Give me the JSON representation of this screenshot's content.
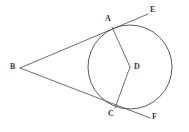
{
  "figure": {
    "type": "geometry-diagram",
    "width": 189,
    "height": 132,
    "background_color": "#ffffff",
    "stroke_color": "#4a4a4a",
    "label_color": "#3a3a3a"
  },
  "circle": {
    "name": "main-circle",
    "center_label": "D",
    "cx": 130,
    "cy": 67,
    "r": 42
  },
  "points": {
    "B": {
      "label": "B",
      "x": 20,
      "y": 68,
      "label_x": 10,
      "label_y": 63,
      "role": "external-point"
    },
    "A": {
      "label": "A",
      "x": 112,
      "y": 27,
      "label_x": 105,
      "label_y": 15,
      "role": "tangent-point-upper"
    },
    "C": {
      "label": "C",
      "x": 115,
      "y": 108,
      "label_x": 108,
      "label_y": 110,
      "role": "tangent-point-lower"
    },
    "D": {
      "label": "D",
      "x": 130,
      "y": 67,
      "label_x": 134,
      "label_y": 63,
      "role": "center"
    },
    "E": {
      "label": "E",
      "x": 148,
      "y": 14,
      "label_x": 150,
      "label_y": 6,
      "role": "tangent-ray-end-upper"
    },
    "F": {
      "label": "F",
      "x": 150,
      "y": 118,
      "label_x": 152,
      "label_y": 113,
      "role": "tangent-ray-end-lower"
    }
  },
  "segments": [
    {
      "name": "tangent-B-A-E",
      "from": "B",
      "to": "E",
      "through": "A"
    },
    {
      "name": "tangent-B-C-F",
      "from": "B",
      "to": "F",
      "through": "C"
    },
    {
      "name": "radius-A-D",
      "from": "A",
      "to": "D"
    },
    {
      "name": "radius-D-C",
      "from": "D",
      "to": "C"
    }
  ],
  "labels": {
    "A": "A",
    "B": "B",
    "C": "C",
    "D": "D",
    "E": "E",
    "F": "F"
  }
}
